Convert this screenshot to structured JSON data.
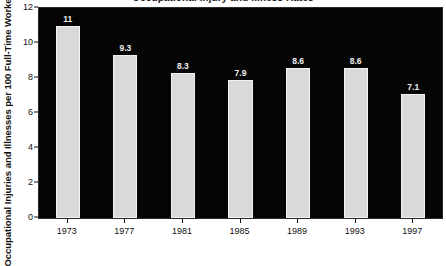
{
  "chart_data": {
    "type": "bar",
    "title": "Occupational Injury and Illness Rates",
    "categories": [
      "1973",
      "1977",
      "1981",
      "1985",
      "1989",
      "1993",
      "1997"
    ],
    "values": [
      11,
      9.3,
      8.3,
      7.9,
      8.6,
      8.6,
      7.1
    ],
    "value_labels": [
      "11",
      "9.3",
      "8.3",
      "7.9",
      "8.6",
      "8.6",
      "7.1"
    ],
    "xlabel": "",
    "ylabel": "Occupational Injuries and Illnesses per 100 Full-Time Workers",
    "ylim": [
      0,
      12
    ],
    "yticks": [
      0,
      2,
      4,
      6,
      8,
      10,
      12
    ],
    "ytick_labels": [
      "0",
      "2",
      "4",
      "6",
      "8",
      "10",
      "12"
    ],
    "grid": false,
    "legend": null,
    "colors": {
      "bar_fill": "#d9d9d9",
      "bar_edge": "#f2f2f2",
      "plot_background": "#050505",
      "figure_background": "#ffffff",
      "axis_text": "#111111",
      "value_label": "#f0f0f0"
    }
  }
}
